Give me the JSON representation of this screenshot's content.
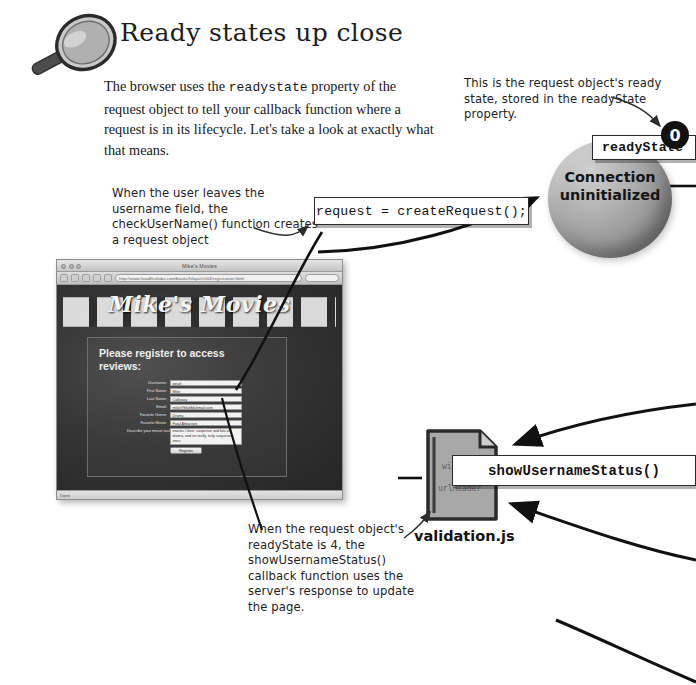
{
  "heading": {
    "title": "Ready states up close",
    "icon": "magnifier-icon"
  },
  "body": {
    "text_before_code": "The browser uses the ",
    "code_term": "readystate",
    "text_after_code": " property of the request object to tell your callback function where a request is in its lifecycle. Let's take a look at exactly what that means."
  },
  "annotations": {
    "ready_state_note": "This is the request object's ready state, stored in the readyState property.",
    "leave_field_note": "When the user leaves the username field, the checkUserName() function creates a request object",
    "ready_state_four_note": "When the request object's readyState is 4, the showUsernameStatus() callback function uses the server's response to update the page."
  },
  "code_boxes": {
    "create_request": "request = createRequest();",
    "ready_state_label": "readyState",
    "show_username_status": "showUsernameStatus()"
  },
  "state": {
    "badge_value": "0",
    "sphere_label_line1": "Connection",
    "sphere_label_line2": "uninitialized"
  },
  "file": {
    "name": "validation.js",
    "visible_code_line1": "win",
    "visible_code_line2": "urlHeader"
  },
  "browser": {
    "window_title": "Mike's Movies",
    "url": "http://www.headfirstlabs.com/books/hfajax/ch04/registration.html",
    "site_logo": "Mike's Movies",
    "page_heading": "Please register to access reviews:",
    "status_text": "Done",
    "fields": [
      {
        "label": "Username:",
        "value": "jonah"
      },
      {
        "label": "First Name:",
        "value": "Mike"
      },
      {
        "label": "Last Name:",
        "value": "Calloway"
      },
      {
        "label": "Email:",
        "value": "mike@blahblahmail.com"
      },
      {
        "label": "Favorite Genre:",
        "value": "Drama"
      },
      {
        "label": "Favorite Movie:",
        "value": "Fatal Attraction"
      },
      {
        "label": "Describe your movie tastes:",
        "value": "movies I love: suspense and lots of drama, and no really, truly suspicious ones"
      }
    ],
    "submit_label": "Register"
  },
  "colors": {
    "page_background": "#ffffff",
    "ink": "#1a1a1a",
    "badge_background": "#111111",
    "badge_text": "#ffffff",
    "sphere_mid": "#9a9a9a",
    "browser_page_background": "#343434"
  }
}
